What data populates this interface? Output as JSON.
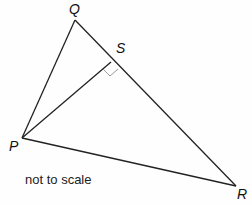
{
  "diagram": {
    "points": {
      "Q": {
        "label": "Q"
      },
      "P": {
        "label": "P"
      },
      "R": {
        "label": "R"
      },
      "S": {
        "label": "S"
      }
    },
    "segments": [
      "PQ",
      "QR",
      "PR",
      "PS"
    ],
    "right_angle_at": "S",
    "note": "not to scale",
    "line_color": "#222222",
    "right_angle_color": "#999999"
  }
}
